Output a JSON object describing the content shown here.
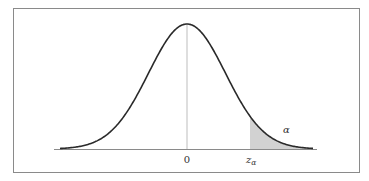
{
  "chart_data": {
    "type": "area",
    "title": "",
    "xlabel": "",
    "ylabel": "",
    "distribution": "standard normal",
    "mean": 0,
    "std": 1,
    "x_range": [
      -3.3,
      3.3
    ],
    "tick_labels": [
      {
        "value": 0,
        "label": "0"
      },
      {
        "value": 1.645,
        "label": "z",
        "subscript": "α"
      }
    ],
    "shaded_region": {
      "from": 1.645,
      "to": 3.3,
      "label": "α",
      "side": "upper tail"
    },
    "annotations": [
      {
        "text": "α",
        "x": 2.2,
        "y": 0.07
      }
    ],
    "center_line": {
      "x": 0
    },
    "grid": false,
    "legend": "none"
  },
  "labels": {
    "zero": "0",
    "z_main": "z",
    "z_sub": "α",
    "alpha": "α"
  },
  "colors": {
    "curve": "#2a2a2a",
    "shade": "#d2d2d2",
    "frame": "#8a8a8a",
    "baseline": "#8a8a8a",
    "center_line": "#bdbdbd",
    "text": "#333333"
  }
}
